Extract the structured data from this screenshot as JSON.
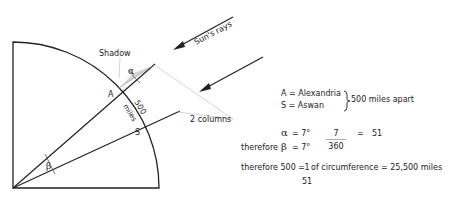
{
  "diagram": {
    "labels": {
      "shadow": "Shadow",
      "suns_rays": "Sun's rays",
      "alpha": "α",
      "beta": "β",
      "point_a": "A",
      "point_s": "S",
      "distance_value": "500",
      "distance_unit": "miles",
      "columns": "2 columns"
    },
    "colors": {
      "line": "#222222",
      "shadow_fill": "#d4d4d4",
      "guide_line": "#c8c8c8"
    }
  },
  "legend": {
    "a_def": "A = Alexandria",
    "s_def": "S = Aswan",
    "apart": "500 miles apart"
  },
  "equations": {
    "line1_alpha": "α",
    "line1_rest": "=  7°",
    "line2_prefix": "therefore",
    "line2_beta": "β",
    "line2_rest": "=  7°",
    "frac1_num": "7",
    "frac1_den": "360",
    "frac1_eq": "=",
    "frac1_result": "51",
    "line3_prefix": "therefore 500  =",
    "frac2_num": "1",
    "frac2_den": "51",
    "line3_rest": "of circumference  =  25,500 miles"
  }
}
